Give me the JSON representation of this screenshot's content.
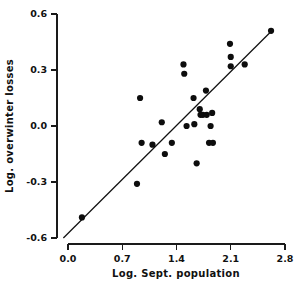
{
  "chart_data": {
    "type": "scatter",
    "title": "",
    "xlabel": "Log. Sept. population",
    "ylabel": "Log. overwinter losses",
    "xlim": [
      -0.07,
      2.8
    ],
    "ylim": [
      -0.6,
      0.6
    ],
    "xticks": [
      0.0,
      0.7,
      1.4,
      2.1,
      2.8
    ],
    "yticks": [
      0.6,
      0.3,
      0.0,
      -0.3,
      -0.6
    ],
    "xticklabels": [
      "0.0",
      "0.7",
      "1.4",
      "2.1",
      "2.8"
    ],
    "yticklabels": [
      "0.6",
      "0.3",
      "0.0",
      "-0.3",
      "-0.6"
    ],
    "grid": false,
    "legend": null,
    "marker": "filled-circle",
    "marker_color": "#0d0d0d",
    "axis_color": "#1a1a1a",
    "background": "#ffffff",
    "series": [
      {
        "name": "observations",
        "points": [
          {
            "x": 0.18,
            "y": -0.49
          },
          {
            "x": 0.89,
            "y": -0.31
          },
          {
            "x": 0.93,
            "y": 0.15
          },
          {
            "x": 0.95,
            "y": -0.09
          },
          {
            "x": 1.09,
            "y": -0.1
          },
          {
            "x": 1.21,
            "y": 0.02
          },
          {
            "x": 1.25,
            "y": -0.15
          },
          {
            "x": 1.34,
            "y": -0.09
          },
          {
            "x": 1.49,
            "y": 0.33
          },
          {
            "x": 1.5,
            "y": 0.28
          },
          {
            "x": 1.53,
            "y": 0.0
          },
          {
            "x": 1.62,
            "y": 0.15
          },
          {
            "x": 1.63,
            "y": 0.01
          },
          {
            "x": 1.66,
            "y": -0.2
          },
          {
            "x": 1.7,
            "y": 0.09
          },
          {
            "x": 1.71,
            "y": 0.06
          },
          {
            "x": 1.74,
            "y": 0.06
          },
          {
            "x": 1.78,
            "y": 0.19
          },
          {
            "x": 1.79,
            "y": 0.06
          },
          {
            "x": 1.82,
            "y": -0.09
          },
          {
            "x": 1.84,
            "y": 0.0
          },
          {
            "x": 1.86,
            "y": 0.07
          },
          {
            "x": 1.87,
            "y": -0.09
          },
          {
            "x": 2.09,
            "y": 0.44
          },
          {
            "x": 2.1,
            "y": 0.37
          },
          {
            "x": 2.1,
            "y": 0.32
          },
          {
            "x": 2.28,
            "y": 0.33
          },
          {
            "x": 2.62,
            "y": 0.51
          }
        ]
      }
    ],
    "fit_line": {
      "name": "regression-line",
      "x_start": -0.06,
      "y_start": -0.6,
      "x_end": 2.63,
      "y_end": 0.51
    }
  }
}
